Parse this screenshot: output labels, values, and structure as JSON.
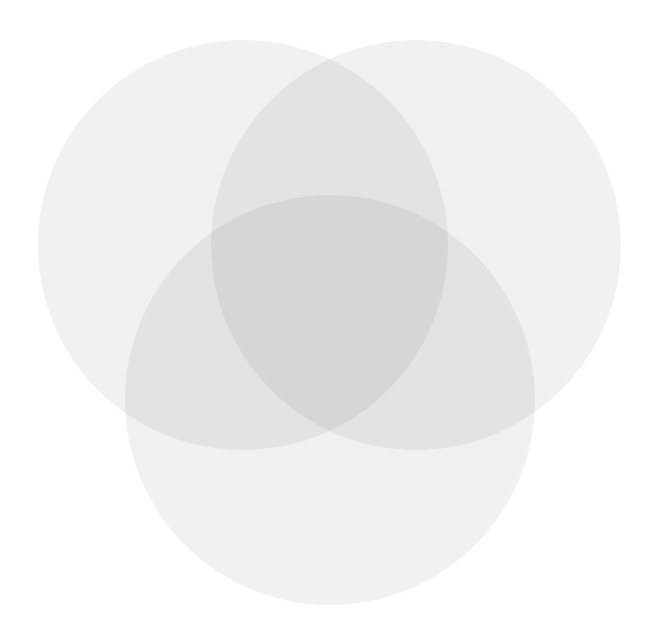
{
  "figure": {
    "title": "",
    "background_color": "#ffffff",
    "width": 661,
    "height": 642
  },
  "chart_data": {
    "type": "venn",
    "title": "",
    "subtitle": "",
    "xlabel": "",
    "ylabel": "",
    "grid": false,
    "legend_position": "none",
    "set_count": 3,
    "labels": [],
    "annotations": [],
    "tick_labels": [],
    "sets": [
      {
        "name": "set-a",
        "label": "",
        "count_label": "",
        "center_x": 243,
        "center_y": 245,
        "radius": 205,
        "fill": "#e8e8e8",
        "opacity": 0.62,
        "stroke": "none"
      },
      {
        "name": "set-b",
        "label": "",
        "count_label": "",
        "center_x": 416,
        "center_y": 245,
        "radius": 205,
        "fill": "#e8e8e8",
        "opacity": 0.62,
        "stroke": "none"
      },
      {
        "name": "set-c",
        "label": "",
        "count_label": "",
        "center_x": 330,
        "center_y": 400,
        "radius": 205,
        "fill": "#e8e8e8",
        "opacity": 0.62,
        "stroke": "none"
      }
    ],
    "region_colors": {
      "background": "#ffffff",
      "single_overlap": "#f2f2f2",
      "double_overlap": "#e3e3e3",
      "triple_overlap": "#cdcdcd"
    }
  }
}
